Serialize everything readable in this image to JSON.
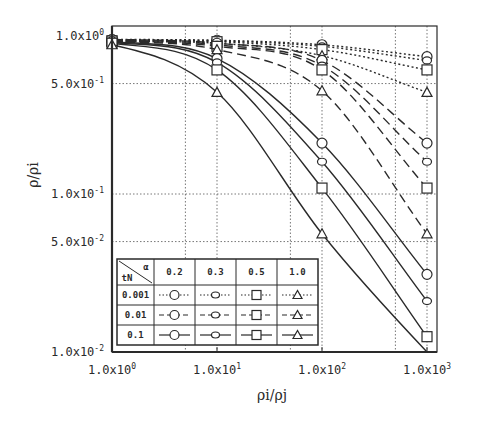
{
  "chart_data": {
    "type": "line",
    "title": "",
    "xlabel": "ρi/ρj",
    "ylabel": "ρ/ρi",
    "xscale": "log",
    "yscale": "log",
    "xlim": [
      1,
      1000
    ],
    "ylim": [
      0.01,
      1.0
    ],
    "x_ticks": [
      {
        "value": 1,
        "label": "1.0x10^0"
      },
      {
        "value": 10,
        "label": "1.0x10^1"
      },
      {
        "value": 100,
        "label": "1.0x10^2"
      },
      {
        "value": 1000,
        "label": "1.0x10^3"
      }
    ],
    "y_ticks": [
      {
        "value": 1.0,
        "label": "1.0x10^0"
      },
      {
        "value": 0.5,
        "label": "5.0x10^-1"
      },
      {
        "value": 0.1,
        "label": "1.0x10^-1"
      },
      {
        "value": 0.05,
        "label": "5.0x10^-2"
      },
      {
        "value": 0.01,
        "label": "1.0x10^-2"
      }
    ],
    "grid": {
      "x": [
        5,
        10,
        50,
        100,
        500,
        1000
      ],
      "y": [
        0.5,
        0.1,
        0.05
      ],
      "style": "dotted"
    },
    "legend": {
      "position": "lower-left",
      "header_row_label": "α",
      "header_col_label": "tN",
      "alpha_values": [
        "0.2",
        "0.3",
        "0.5",
        "1.0"
      ],
      "markers": [
        "circle",
        "diamond",
        "square",
        "triangle"
      ],
      "tN_values": [
        "0.001",
        "0.01",
        "0.1"
      ],
      "line_styles": [
        "dotted",
        "dashed",
        "solid"
      ]
    },
    "x": [
      1,
      10,
      100,
      1000
    ],
    "series": [
      {
        "name": "tN=0.001, α=0.2",
        "tN": "0.001",
        "alpha": "0.2",
        "line": "dotted",
        "marker": "circle",
        "values": [
          0.95,
          0.94,
          0.88,
          0.74
        ]
      },
      {
        "name": "tN=0.001, α=0.3",
        "tN": "0.001",
        "alpha": "0.3",
        "line": "dotted",
        "marker": "diamond",
        "values": [
          0.94,
          0.93,
          0.86,
          0.7
        ]
      },
      {
        "name": "tN=0.001, α=0.5",
        "tN": "0.001",
        "alpha": "0.5",
        "line": "dotted",
        "marker": "square",
        "values": [
          0.93,
          0.92,
          0.82,
          0.61
        ]
      },
      {
        "name": "tN=0.001, α=1.0",
        "tN": "0.001",
        "alpha": "1.0",
        "line": "dotted",
        "marker": "triangle",
        "values": [
          0.92,
          0.9,
          0.75,
          0.44
        ]
      },
      {
        "name": "tN=0.01, α=0.2",
        "tN": "0.01",
        "alpha": "0.2",
        "line": "dashed",
        "marker": "circle",
        "values": [
          0.95,
          0.9,
          0.7,
          0.21
        ]
      },
      {
        "name": "tN=0.01, α=0.3",
        "tN": "0.01",
        "alpha": "0.3",
        "line": "dashed",
        "marker": "diamond",
        "values": [
          0.94,
          0.88,
          0.65,
          0.16
        ]
      },
      {
        "name": "tN=0.01, α=0.5",
        "tN": "0.01",
        "alpha": "0.5",
        "line": "dashed",
        "marker": "square",
        "values": [
          0.93,
          0.86,
          0.61,
          0.109
        ]
      },
      {
        "name": "tN=0.01, α=1.0",
        "tN": "0.01",
        "alpha": "1.0",
        "line": "dashed",
        "marker": "triangle",
        "values": [
          0.92,
          0.82,
          0.45,
          0.056
        ]
      },
      {
        "name": "tN=0.1, α=0.2",
        "tN": "0.1",
        "alpha": "0.2",
        "line": "solid",
        "marker": "circle",
        "values": [
          0.92,
          0.72,
          0.21,
          0.031
        ]
      },
      {
        "name": "tN=0.1, α=0.3",
        "tN": "0.1",
        "alpha": "0.3",
        "line": "solid",
        "marker": "diamond",
        "values": [
          0.91,
          0.68,
          0.16,
          0.021
        ]
      },
      {
        "name": "tN=0.1, α=0.5",
        "tN": "0.1",
        "alpha": "0.5",
        "line": "solid",
        "marker": "square",
        "values": [
          0.9,
          0.61,
          0.109,
          0.0125
        ]
      },
      {
        "name": "tN=0.1, α=1.0",
        "tN": "0.1",
        "alpha": "1.0",
        "line": "solid",
        "marker": "triangle",
        "values": [
          0.88,
          0.44,
          0.056,
          0.0095
        ]
      }
    ]
  },
  "labels": {
    "xlabel": "ρi/ρj",
    "ylabel": "ρ/ρi",
    "legend_alpha": "α",
    "legend_tN": "tN"
  }
}
